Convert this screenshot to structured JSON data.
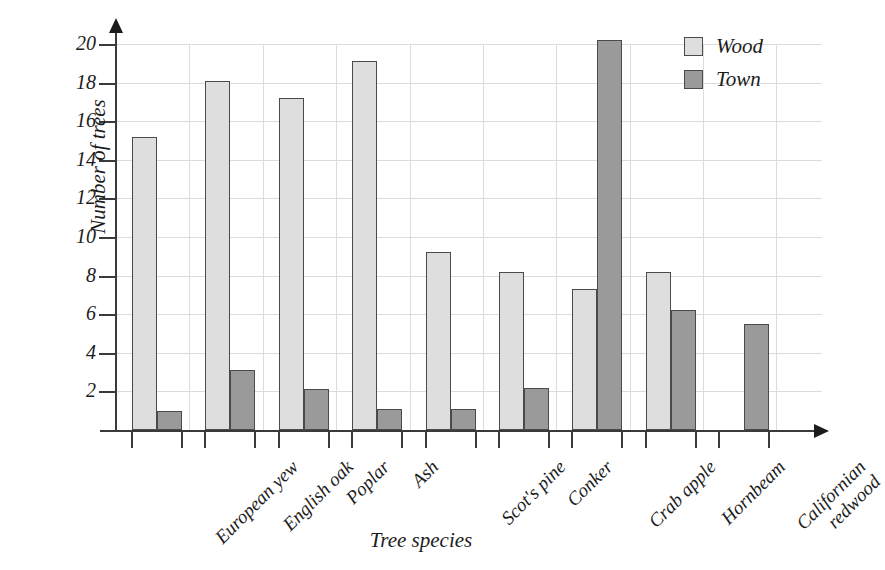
{
  "chart_data": {
    "type": "bar",
    "title": "",
    "xlabel": "Tree species",
    "ylabel": "Number of trees",
    "ylim": [
      0,
      20
    ],
    "ytick_values": [
      2,
      4,
      6,
      8,
      10,
      12,
      14,
      16,
      18,
      20
    ],
    "ytick_labels": [
      "2",
      "4",
      "6",
      "8",
      "10",
      "12",
      "14",
      "16",
      "18",
      "20"
    ],
    "grid": true,
    "legend_position": "top-right",
    "categories": [
      "European yew",
      "English oak",
      "Poplar",
      "Ash",
      "Scot's pine",
      "Conker",
      "Crab apple",
      "Hornbeam",
      "Californian\nredwood"
    ],
    "series": [
      {
        "name": "Wood",
        "color": "#dedede",
        "values": [
          15.2,
          18.1,
          17.2,
          19.1,
          9.2,
          8.2,
          7.3,
          8.2,
          0
        ]
      },
      {
        "name": "Town",
        "color": "#9a9a9a",
        "values": [
          1.0,
          3.1,
          2.1,
          1.1,
          1.1,
          2.2,
          20.2,
          6.2,
          5.5
        ]
      }
    ]
  },
  "legend": {
    "items": [
      {
        "label": "Wood",
        "swatch": "wood"
      },
      {
        "label": "Town",
        "swatch": "town"
      }
    ]
  },
  "colors": {
    "wood": "#dedede",
    "town": "#9a9a9a",
    "axis": "#3a3a3a",
    "grid": "#dcdcdc",
    "text": "#1c1c1c"
  }
}
